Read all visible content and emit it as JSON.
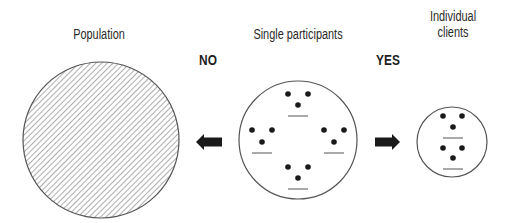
{
  "colors": {
    "stroke": "#555555",
    "hatch": "#6a6a6a",
    "dot": "#1a1a1a",
    "arrow": "#1a1a1a",
    "text": "#2a2a2a"
  },
  "labels": {
    "population": "Population",
    "single_participants": "Single participants",
    "individual_line1": "Individual",
    "individual_line2": "clients",
    "no": "NO",
    "yes": "YES"
  },
  "nodes": [
    {
      "id": "population",
      "cx": 101,
      "cy": 140,
      "r": 78,
      "fill": "hatched",
      "groups": []
    },
    {
      "id": "single-participants",
      "cx": 298,
      "cy": 140,
      "r": 59,
      "fill": "none",
      "groups": [
        {
          "dots": [
            [
              288,
              94
            ],
            [
              308,
              94
            ],
            [
              298,
              105
            ]
          ],
          "line": [
            288,
            116,
            308,
            116
          ]
        },
        {
          "dots": [
            [
              252,
              130
            ],
            [
              272,
              130
            ],
            [
              262,
              142
            ]
          ],
          "line": [
            252,
            153,
            272,
            153
          ]
        },
        {
          "dots": [
            [
              324,
              130
            ],
            [
              344,
              130
            ],
            [
              334,
              142
            ]
          ],
          "line": [
            324,
            153,
            344,
            153
          ]
        },
        {
          "dots": [
            [
              288,
              167
            ],
            [
              308,
              167
            ],
            [
              298,
              178
            ]
          ],
          "line": [
            288,
            189,
            308,
            189
          ]
        }
      ]
    },
    {
      "id": "individual-clients",
      "cx": 452,
      "cy": 142,
      "r": 35,
      "fill": "none",
      "groups": [
        {
          "dots": [
            [
              443,
              116
            ],
            [
              462,
              116
            ],
            [
              453,
              127
            ]
          ],
          "line": [
            443,
            138,
            463,
            138
          ]
        },
        {
          "dots": [
            [
              443,
              148
            ],
            [
              462,
              148
            ],
            [
              453,
              158
            ]
          ],
          "line": [
            443,
            169,
            463,
            169
          ]
        }
      ]
    }
  ],
  "arrows": [
    {
      "id": "no-arrow",
      "direction": "left",
      "x1": 196,
      "x2": 222,
      "cy": 142
    },
    {
      "id": "yes-arrow",
      "direction": "right",
      "x1": 375,
      "x2": 400,
      "cy": 142
    }
  ]
}
